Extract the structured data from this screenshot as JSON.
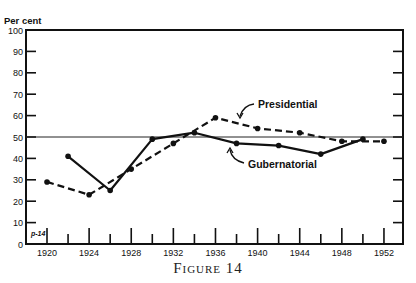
{
  "chart_data": {
    "type": "line",
    "title": "",
    "caption": "Figure 14",
    "ylabel": "Per cent",
    "xlabel": "",
    "ylim": [
      0,
      100
    ],
    "xlim": [
      1918,
      1954
    ],
    "yticks": [
      0,
      10,
      20,
      30,
      40,
      50,
      60,
      70,
      80,
      90,
      100
    ],
    "xticks": [
      1920,
      1924,
      1928,
      1932,
      1936,
      1940,
      1944,
      1948,
      1952
    ],
    "reference_line": 50,
    "grid": false,
    "corner_annotation": "p-14",
    "series": [
      {
        "name": "Presidential",
        "style": "dashed",
        "x": [
          1920,
          1924,
          1928,
          1932,
          1936,
          1940,
          1944,
          1948,
          1952
        ],
        "values": [
          29,
          23,
          35,
          47,
          59,
          54,
          52,
          48,
          48
        ]
      },
      {
        "name": "Gubernatorial",
        "style": "solid",
        "x": [
          1922,
          1926,
          1930,
          1934,
          1938,
          1942,
          1946,
          1950
        ],
        "values": [
          41,
          25,
          49,
          52,
          47,
          46,
          42,
          49
        ]
      }
    ],
    "annotations": [
      {
        "text": "Presidential",
        "points_to": "Presidential"
      },
      {
        "text": "Gubernatorial",
        "points_to": "Gubernatorial"
      }
    ]
  }
}
